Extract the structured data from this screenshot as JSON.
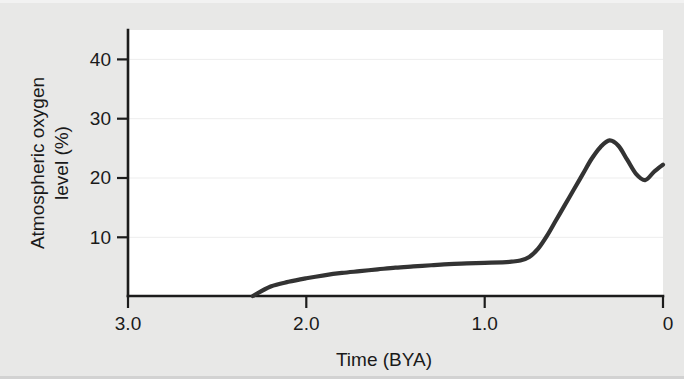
{
  "chart_data": {
    "type": "line",
    "title": "",
    "xlabel": "Time (BYA)",
    "ylabel_line1": "Atmospheric oxygen",
    "ylabel_line2": "level (%)",
    "ylabel": "Atmospheric oxygen level (%)",
    "x_ticks": [
      "3.0",
      "2.0",
      "1.0",
      "0"
    ],
    "x_tick_values": [
      3.0,
      2.0,
      1.0,
      0
    ],
    "y_ticks": [
      "10",
      "20",
      "30",
      "40"
    ],
    "y_tick_values": [
      10,
      20,
      30,
      40
    ],
    "xlim": [
      3.0,
      0
    ],
    "ylim": [
      0,
      45
    ],
    "x_axis_reversed": true,
    "grid": true,
    "grid_orientation": "horizontal",
    "legend": "none",
    "series": [
      {
        "name": "Atmospheric oxygen level",
        "color": "#333333",
        "x": [
          2.3,
          2.2,
          2.1,
          2.0,
          1.9,
          1.8,
          1.7,
          1.6,
          1.5,
          1.4,
          1.3,
          1.2,
          1.1,
          1.0,
          0.9,
          0.85,
          0.8,
          0.75,
          0.7,
          0.65,
          0.6,
          0.55,
          0.5,
          0.45,
          0.4,
          0.35,
          0.3,
          0.25,
          0.2,
          0.15,
          0.1,
          0.05,
          0.0
        ],
        "values": [
          0.0,
          1.6,
          2.4,
          3.0,
          3.5,
          3.9,
          4.2,
          4.5,
          4.8,
          5.0,
          5.2,
          5.4,
          5.5,
          5.6,
          5.7,
          5.8,
          6.0,
          6.6,
          8.0,
          10.2,
          12.8,
          15.4,
          18.0,
          20.6,
          23.2,
          25.2,
          26.3,
          25.4,
          23.0,
          20.6,
          19.6,
          21.0,
          22.2
        ]
      }
    ],
    "annotations": [],
    "notable_points": {
      "curve_start": {
        "x": 2.3,
        "y": 0
      },
      "plateau_level": 5.6,
      "peak": {
        "x": 0.3,
        "y": 26.3
      },
      "dip": {
        "x": 0.1,
        "y": 19.6
      },
      "present_day": {
        "x": 0,
        "y": 22.2
      }
    }
  },
  "figure": {
    "background_color": "#e8e8e7",
    "plot_background_color": "#ffffff",
    "axis_color": "#1c1c1c",
    "curve_color": "#333333",
    "grid_color": "#ededed"
  }
}
